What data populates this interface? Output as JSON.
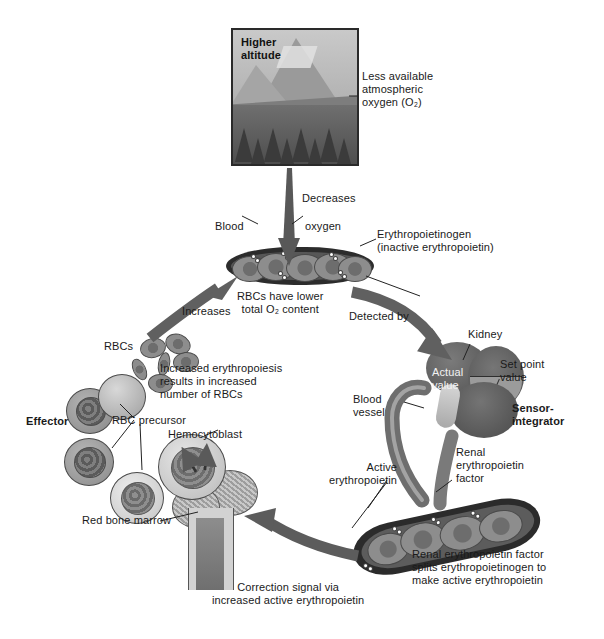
{
  "figure": {
    "background": "#ffffff"
  },
  "photo_panel": {
    "caption": "Higher\naltitude",
    "side_note": "Less available\natmospheric\noxygen (O₂)"
  },
  "labels": {
    "decreases": "Decreases",
    "blood": "Blood",
    "oxygen": "oxygen",
    "erythropoietinogen": "Erythropoietinogen\n(inactive erythropoietin)",
    "rbc_low_o2": "RBCs have lower\ntotal O₂ content",
    "detected_by": "Detected by",
    "increases": "Increases",
    "kidney": "Kidney",
    "actual_value": "Actual\nvalue",
    "set_point_value": "Set point\nvalue",
    "sensor_integrator": "Sensor-\nintegrator",
    "blood_vessel": "Blood\nvessel",
    "renal_epo_factor": "Renal\nerythropoietin\nfactor",
    "active_epo_right": "Active\nerythropoietin",
    "renal_split_text": "Renal erythropoietin factor\nsplits erythropoietinogen to\nmake active erythropoietin",
    "correction_signal": "Correction signal via\nincreased active erythropoietin",
    "red_bone_marrow": "Red bone marrow",
    "hemocytoblast": "Hemocytoblast",
    "rbc_precursor": "RBC precursor",
    "effector": "Effector",
    "rbcs": "RBCs",
    "increased_erythropoiesis": "Increased erythropoiesis\nresults in increased\nnumber of RBCs"
  },
  "colors": {
    "ink": "#1a1a1a",
    "arrow_gray": "#5a5a5a",
    "arrow_dark": "#4a4a4a",
    "cell_outline": "#4a4a4a",
    "kidney": "#6a6a6a",
    "bone": "#bdbdbd"
  },
  "flow_steps": [
    {
      "id": "higher-altitude",
      "label": "Higher altitude"
    },
    {
      "id": "decreases-blood-oxygen",
      "label": "Decreases"
    },
    {
      "id": "detected-by-kidney",
      "label": "Detected by"
    },
    {
      "id": "renal-epo-factor-splits",
      "label": "Renal erythropoietin factor splits erythropoietinogen to make active erythropoietin"
    },
    {
      "id": "correction-signal",
      "label": "Correction signal via increased active erythropoietin"
    },
    {
      "id": "red-bone-marrow-effector",
      "label": "Effector"
    },
    {
      "id": "increases-rbcs",
      "label": "Increases"
    }
  ]
}
